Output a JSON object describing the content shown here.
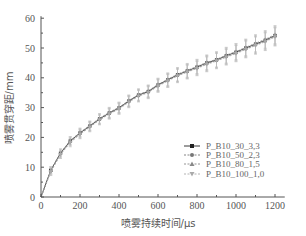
{
  "chart_data": {
    "type": "line",
    "title": "",
    "xlabel": "喷雾持续时间/μs",
    "ylabel": "喷雾贯穿距/mm",
    "xlim": [
      0,
      1250
    ],
    "ylim": [
      0,
      60
    ],
    "xticks": [
      0,
      200,
      400,
      600,
      800,
      1000,
      1200
    ],
    "yticks": [
      0,
      10,
      20,
      30,
      40,
      50,
      60
    ],
    "grid": false,
    "legend_position": "lower right",
    "x": [
      50,
      100,
      150,
      200,
      250,
      300,
      350,
      400,
      450,
      500,
      550,
      600,
      650,
      700,
      750,
      800,
      850,
      900,
      950,
      1000,
      1050,
      1100,
      1150,
      1200
    ],
    "series": [
      {
        "name": "P_B10_30_3,3",
        "marker": "square",
        "color": "#222222",
        "values": [
          9.0,
          14.7,
          18.8,
          21.5,
          23.8,
          26.2,
          28.2,
          29.9,
          32.2,
          34.2,
          35.4,
          37.6,
          39.3,
          41.0,
          42.3,
          43.6,
          45.0,
          46.0,
          47.4,
          48.6,
          50.0,
          51.3,
          52.6,
          54.2
        ]
      },
      {
        "name": "P_B10_50_2,3",
        "marker": "circle",
        "color": "#777777",
        "values": [
          8.6,
          14.4,
          18.5,
          21.2,
          23.6,
          26.0,
          28.0,
          29.7,
          32.0,
          34.0,
          35.2,
          37.4,
          39.1,
          40.8,
          42.1,
          43.3,
          44.7,
          45.8,
          47.1,
          48.3,
          49.7,
          51.0,
          52.3,
          53.9
        ]
      },
      {
        "name": "P_B10_80_1,5",
        "marker": "triangle-up",
        "color": "#888888",
        "values": [
          8.9,
          14.9,
          18.9,
          21.7,
          24.0,
          26.4,
          28.4,
          30.1,
          32.4,
          34.4,
          35.6,
          37.8,
          39.5,
          41.2,
          42.5,
          43.8,
          45.2,
          46.2,
          47.6,
          48.8,
          50.2,
          51.6,
          52.9,
          54.5
        ]
      },
      {
        "name": "P_B10_100_1,0",
        "marker": "triangle-down",
        "color": "#aaaaaa",
        "values": [
          8.4,
          14.2,
          18.2,
          21.0,
          23.4,
          25.8,
          27.8,
          29.5,
          31.8,
          33.8,
          35.0,
          37.2,
          38.9,
          40.6,
          41.9,
          43.1,
          44.5,
          45.6,
          46.9,
          48.1,
          49.5,
          50.8,
          52.1,
          53.7
        ]
      }
    ]
  },
  "axes": {
    "x_title": "喷雾持续时间/μs",
    "y_title": "喷雾贯穿距/mm"
  },
  "legend": [
    {
      "label": "P_B10_30_3,3"
    },
    {
      "label": "P_B10_50_2,3"
    },
    {
      "label": "P_B10_80_1,5"
    },
    {
      "label": "P_B10_100_1,0"
    }
  ]
}
